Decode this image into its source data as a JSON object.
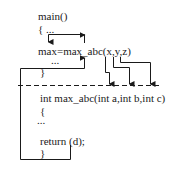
{
  "diagram": {
    "caller": {
      "line1": "main()",
      "line2": "{ ...",
      "call": "max=max_abc(x,y,z)",
      "line4": "...",
      "line5": "}"
    },
    "callee": {
      "signature": "int max_abc(int a,int b,int c)",
      "open": "{",
      "body": "...",
      "ret": "return (d);",
      "close": "}"
    },
    "arrows": [
      {
        "from": "call",
        "to": "assignment",
        "meaning": "return value assigned to max"
      },
      {
        "from": "x",
        "to": "a"
      },
      {
        "from": "y",
        "to": "b"
      },
      {
        "from": "z",
        "to": "c"
      },
      {
        "from": "return (d)",
        "to": "call site"
      }
    ],
    "colors": {
      "line": "#1a1a1a",
      "background": "#ffffff"
    }
  }
}
